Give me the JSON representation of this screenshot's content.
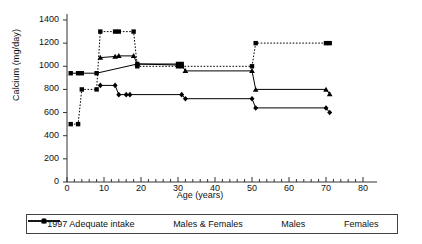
{
  "chart_data": {
    "type": "line",
    "title": "",
    "xlabel": "Age (years)",
    "ylabel": "Calcium (mg/day)",
    "xlim": [
      0,
      80
    ],
    "ylim": [
      0,
      1400
    ],
    "xticks": [
      0,
      10,
      20,
      30,
      40,
      50,
      60,
      70,
      80
    ],
    "yticks": [
      0,
      200,
      400,
      600,
      800,
      1000,
      1200,
      1400
    ],
    "x_minor_tick_step": 2,
    "grid": false,
    "legend_position": "below-axes",
    "series": [
      {
        "name": "1997 Adequate intake",
        "style": "dotted",
        "marker": "square",
        "color": "#000000",
        "points": [
          {
            "x": 1,
            "y": 500
          },
          {
            "x": 3,
            "y": 500
          },
          {
            "x": 4,
            "y": 800
          },
          {
            "x": 8,
            "y": 800
          },
          {
            "x": 9,
            "y": 1300
          },
          {
            "x": 13,
            "y": 1300
          },
          {
            "x": 14,
            "y": 1300
          },
          {
            "x": 18,
            "y": 1300
          },
          {
            "x": 19,
            "y": 1000
          },
          {
            "x": 30,
            "y": 1000
          },
          {
            "x": 31,
            "y": 1000
          },
          {
            "x": 50,
            "y": 1000
          },
          {
            "x": 51,
            "y": 1200
          },
          {
            "x": 70,
            "y": 1200
          },
          {
            "x": 71,
            "y": 1200
          }
        ]
      },
      {
        "name": "Males & Females",
        "style": "solid",
        "marker": "square",
        "color": "#000000",
        "points": [
          {
            "x": 1,
            "y": 940
          },
          {
            "x": 3,
            "y": 940
          },
          {
            "x": 4,
            "y": 940
          },
          {
            "x": 8,
            "y": 940
          },
          {
            "x": 19,
            "y": 1020
          },
          {
            "x": 30,
            "y": 1020
          },
          {
            "x": 31,
            "y": 1020
          }
        ]
      },
      {
        "name": "Males",
        "style": "solid",
        "marker": "triangle",
        "color": "#000000",
        "points": [
          {
            "x": 9,
            "y": 1075
          },
          {
            "x": 13,
            "y": 1085
          },
          {
            "x": 14,
            "y": 1090
          },
          {
            "x": 18,
            "y": 1090
          },
          {
            "x": 19,
            "y": 1020
          },
          {
            "x": 31,
            "y": 1010
          },
          {
            "x": 32,
            "y": 960
          },
          {
            "x": 50,
            "y": 960
          },
          {
            "x": 51,
            "y": 800
          },
          {
            "x": 70,
            "y": 800
          },
          {
            "x": 71,
            "y": 760
          }
        ]
      },
      {
        "name": "Females",
        "style": "solid",
        "marker": "diamond",
        "color": "#000000",
        "points": [
          {
            "x": 9,
            "y": 835
          },
          {
            "x": 13,
            "y": 835
          },
          {
            "x": 14,
            "y": 755
          },
          {
            "x": 16,
            "y": 755
          },
          {
            "x": 17,
            "y": 755
          },
          {
            "x": 31,
            "y": 755
          },
          {
            "x": 32,
            "y": 720
          },
          {
            "x": 50,
            "y": 720
          },
          {
            "x": 51,
            "y": 640
          },
          {
            "x": 70,
            "y": 640
          },
          {
            "x": 71,
            "y": 600
          }
        ]
      }
    ]
  },
  "axes": {
    "ylabel": "Calcium (mg/day)",
    "xlabel": "Age (years)",
    "yticks": [
      "1400",
      "1200",
      "1000",
      "800",
      "600",
      "400",
      "200",
      "0"
    ],
    "xticks": [
      "0",
      "10",
      "20",
      "30",
      "40",
      "50",
      "60",
      "70",
      "80"
    ]
  },
  "legend": {
    "items": [
      {
        "label": "1997 Adequate intake",
        "style": "dotted",
        "marker": "square"
      },
      {
        "label": "Males & Females",
        "style": "solid",
        "marker": "square"
      },
      {
        "label": "Males",
        "style": "solid",
        "marker": "triangle"
      },
      {
        "label": "Females",
        "style": "solid",
        "marker": "diamond"
      }
    ]
  }
}
